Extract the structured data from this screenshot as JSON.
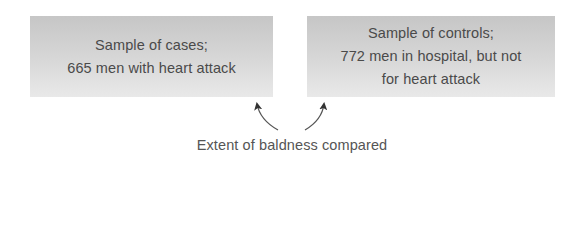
{
  "diagram": {
    "boxes": [
      {
        "id": "cases",
        "lines": [
          "Sample of cases;",
          "665 men with heart attack"
        ]
      },
      {
        "id": "controls",
        "lines": [
          "Sample of controls;",
          "772 men in hospital, but not",
          "for heart attack"
        ]
      }
    ],
    "caption": "Extent of baldness compared",
    "arrows": [
      {
        "from": "caption",
        "to": "cases"
      },
      {
        "from": "caption",
        "to": "controls"
      }
    ],
    "colors": {
      "box_gradient_top": "#c6c6c6",
      "box_gradient_bottom": "#e9e9e9",
      "text": "#4a4a4a",
      "arrow": "#555555"
    }
  }
}
